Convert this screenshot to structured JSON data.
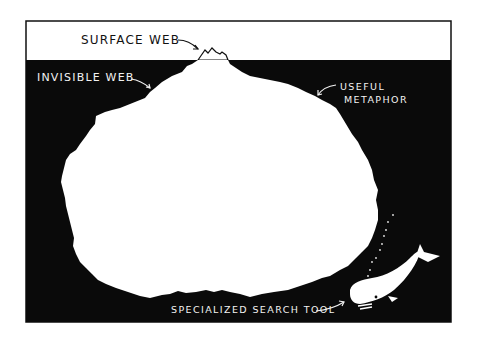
{
  "illustration": {
    "title": "Iceberg metaphor",
    "labels": {
      "surface_web": "SURFACE WEB",
      "invisible_web": "INVISIBLE WEB",
      "useful_metaphor_line1": "USEFUL",
      "useful_metaphor_line2": "METAPHOR",
      "specialized_search_tool": "SPECIALIZED SEARCH TOOL"
    },
    "colors": {
      "sky": "#ffffff",
      "water": "#0a0a0a",
      "iceberg": "#ffffff",
      "ink": "#111111"
    },
    "elements": [
      "iceberg-tip",
      "iceberg-underwater",
      "whale",
      "bubbles",
      "frame"
    ]
  }
}
